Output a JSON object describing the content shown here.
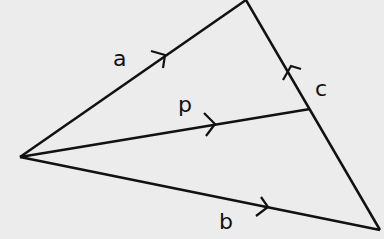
{
  "diagram": {
    "type": "vector-triangle",
    "background": "#ececec",
    "stroke": "#111111",
    "vertices": {
      "left": [
        20,
        157
      ],
      "top": [
        246,
        0
      ],
      "bottom_right": [
        380,
        230
      ],
      "p_end": [
        310,
        109
      ]
    },
    "vectors": [
      {
        "name": "a",
        "label": "a",
        "from": "left",
        "to": "top"
      },
      {
        "name": "b",
        "label": "b",
        "from": "left",
        "to": "bottom_right"
      },
      {
        "name": "c",
        "label": "c",
        "from": "bottom_right",
        "to": "top"
      },
      {
        "name": "p",
        "label": "p",
        "from": "left",
        "to": "p_end"
      }
    ],
    "labels": {
      "a": "a",
      "b": "b",
      "c": "c",
      "p": "p"
    }
  }
}
